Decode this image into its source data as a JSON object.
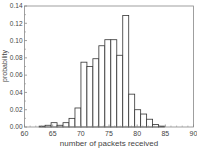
{
  "chart_data": {
    "type": "bar",
    "title": "",
    "xlabel": "number of packets received",
    "ylabel": "probability",
    "xlim": [
      60,
      90
    ],
    "ylim": [
      0,
      0.14
    ],
    "xticks": [
      60,
      65,
      70,
      75,
      80,
      85,
      90
    ],
    "yticks": [
      0.0,
      0.02,
      0.04,
      0.06,
      0.08,
      0.1,
      0.12,
      0.14
    ],
    "ytick_labels": [
      "0.00",
      "0.02",
      "0.04",
      "0.06",
      "0.08",
      "0.10",
      "0.12",
      "0.14"
    ],
    "grid": false,
    "legend": null,
    "bar_style": "unfilled outline histogram",
    "categories": [
      63,
      64,
      65,
      66,
      67,
      68,
      69,
      70,
      71,
      72,
      73,
      74,
      75,
      76,
      77,
      78,
      79,
      80,
      81,
      82,
      83,
      84,
      85,
      86
    ],
    "values": [
      0.001,
      0.002,
      0.005,
      0.002,
      0.005,
      0.01,
      0.022,
      0.075,
      0.07,
      0.079,
      0.094,
      0.101,
      0.101,
      0.083,
      0.129,
      0.038,
      0.02,
      0.015,
      0.009,
      0.003,
      0.001,
      0.0,
      0.0,
      0.0
    ],
    "bin_start": 62.6,
    "bin_width": 1.06
  },
  "colors": {
    "axis": "#888888",
    "bar_stroke": "#333333",
    "bar_fill": "#ffffff",
    "text": "#444444"
  }
}
